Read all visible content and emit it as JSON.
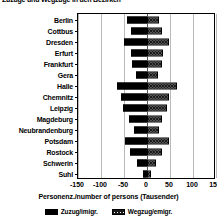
{
  "title": "Zuzüge und Wegzüge in den Bezirken",
  "chart_data": {
    "type": "bar",
    "orientation": "horizontal",
    "layout": "diverging",
    "title": "Zuzüge und Wegzüge in den Bezirken",
    "xlabel": "Personenz./number of persons (Tausender)",
    "ylabel": "",
    "xlim": [
      -150,
      150
    ],
    "xticks": [
      -150,
      -100,
      -50,
      0,
      50,
      100,
      150
    ],
    "xtick_labels": [
      "-150",
      "-100",
      "-50",
      "0",
      "50",
      "100",
      "150"
    ],
    "grid": true,
    "legend_position": "bottom",
    "categories": [
      "Berlin",
      "Cottbus",
      "Dresden",
      "Erfurt",
      "Frankfurt",
      "Gera",
      "Halle",
      "Chemnitz",
      "Leipzig",
      "Magdeburg",
      "Neubrandenburg",
      "Potsdam",
      "Rostock",
      "Schwerin",
      "Suhl"
    ],
    "series": [
      {
        "name": "Zuzug/imigr.",
        "direction": "left",
        "color": "#000000",
        "pattern": "solid",
        "values": [
          -43,
          -35,
          -50,
          -34,
          -32,
          -23,
          -65,
          -57,
          -53,
          -40,
          -28,
          -47,
          -36,
          -22,
          -9
        ]
      },
      {
        "name": "Wegzug/emigr.",
        "direction": "right",
        "color": "#ffffff",
        "pattern": "crosshatch",
        "values": [
          25,
          33,
          47,
          34,
          32,
          23,
          65,
          47,
          43,
          33,
          25,
          47,
          33,
          20,
          9
        ]
      }
    ]
  },
  "legend": {
    "items": [
      {
        "label": "Zuzug/imigr.",
        "swatch": "solid"
      },
      {
        "label": "Wegzug/emigr.",
        "swatch": "hatch"
      }
    ]
  },
  "axis": {
    "x_title": "Personenz./number of persons (Tausender)"
  }
}
